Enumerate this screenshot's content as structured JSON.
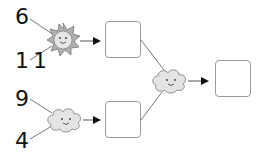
{
  "diagram": {
    "type": "function-machine",
    "inputs": [
      {
        "id": "a",
        "value": "6"
      },
      {
        "id": "b",
        "value": "11"
      },
      {
        "id": "c",
        "value": "9"
      },
      {
        "id": "d",
        "value": "4"
      }
    ],
    "operators": [
      {
        "id": "op1",
        "icon": "sun-icon",
        "inputs": [
          "6",
          "11"
        ]
      },
      {
        "id": "op2",
        "icon": "cloud-icon",
        "inputs": [
          "9",
          "4"
        ]
      },
      {
        "id": "op3",
        "icon": "cloud-icon",
        "inputs": [
          "box1",
          "box2"
        ]
      }
    ],
    "boxes": [
      {
        "id": "box1",
        "value": ""
      },
      {
        "id": "box2",
        "value": ""
      },
      {
        "id": "box3",
        "value": ""
      }
    ]
  }
}
